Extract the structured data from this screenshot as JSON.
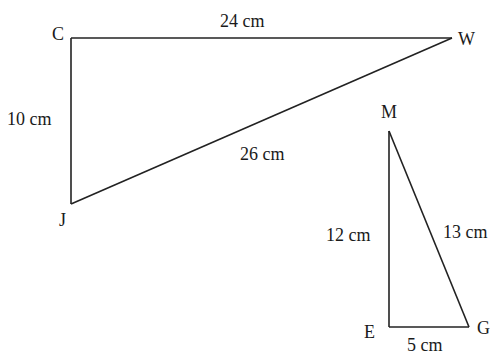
{
  "diagram": {
    "triangles": [
      {
        "name": "CWJ",
        "vertices": [
          {
            "label": "C",
            "x": 71,
            "y": 38,
            "lx": 52,
            "ly": 40
          },
          {
            "label": "W",
            "x": 452,
            "y": 38,
            "lx": 458,
            "ly": 45
          },
          {
            "label": "J",
            "x": 71,
            "y": 204,
            "lx": 59,
            "ly": 226
          }
        ],
        "sides": [
          {
            "from": "C",
            "to": "W",
            "label": "24 cm",
            "lx": 220,
            "ly": 26
          },
          {
            "from": "C",
            "to": "J",
            "label": "10 cm",
            "lx": 7,
            "ly": 125
          },
          {
            "from": "J",
            "to": "W",
            "label": "26 cm",
            "lx": 240,
            "ly": 159
          }
        ]
      },
      {
        "name": "MEG",
        "vertices": [
          {
            "label": "M",
            "x": 389,
            "y": 131,
            "lx": 381,
            "ly": 118
          },
          {
            "label": "E",
            "x": 389,
            "y": 327,
            "lx": 364,
            "ly": 337
          },
          {
            "label": "G",
            "x": 469,
            "y": 327,
            "lx": 477,
            "ly": 333
          }
        ],
        "sides": [
          {
            "from": "M",
            "to": "E",
            "label": "12 cm",
            "lx": 326,
            "ly": 240
          },
          {
            "from": "M",
            "to": "G",
            "label": "13 cm",
            "lx": 443,
            "ly": 237
          },
          {
            "from": "E",
            "to": "G",
            "label": "5 cm",
            "lx": 407,
            "ly": 350
          }
        ]
      }
    ]
  }
}
